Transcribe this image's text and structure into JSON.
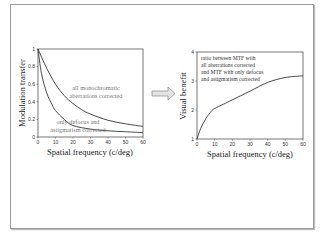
{
  "chart_data": [
    {
      "type": "line",
      "title": "",
      "xlabel": "Spatial frequency (c/deg)",
      "ylabel": "Modulation transfer",
      "xlim": [
        0,
        60
      ],
      "ylim": [
        0,
        1
      ],
      "xticks": [
        "0",
        "10",
        "20",
        "30",
        "40",
        "50",
        "60"
      ],
      "yticks": [
        "0",
        "0.2",
        "0.4",
        "0.6",
        "0.8",
        "1"
      ],
      "grid": false,
      "series": [
        {
          "name": "all monochromatic aberrations corrected",
          "x": [
            0,
            5,
            10,
            15,
            20,
            25,
            30,
            40,
            50,
            60
          ],
          "values": [
            1.0,
            0.78,
            0.6,
            0.47,
            0.38,
            0.31,
            0.26,
            0.19,
            0.15,
            0.12
          ]
        },
        {
          "name": "only defocus and astigmatism corrected",
          "x": [
            0,
            2,
            5,
            8,
            10,
            15,
            20,
            30,
            40,
            50,
            60
          ],
          "values": [
            1.0,
            0.72,
            0.5,
            0.37,
            0.3,
            0.2,
            0.13,
            0.09,
            0.07,
            0.06,
            0.05
          ]
        }
      ],
      "annotations": [
        {
          "lines": [
            "all monochromatic",
            "aberrations corrected"
          ]
        },
        {
          "lines": [
            "only defocus and",
            "astigmatism corrected"
          ]
        }
      ]
    },
    {
      "type": "line",
      "title": "",
      "xlabel": "Spatial frequency (c/deg)",
      "ylabel": "Visual benefit",
      "xlim": [
        0,
        60
      ],
      "ylim": [
        1,
        4
      ],
      "xticks": [
        "0",
        "10",
        "20",
        "30",
        "40",
        "50",
        "60"
      ],
      "yticks": [
        "1",
        "2",
        "3",
        "4"
      ],
      "grid": false,
      "series": [
        {
          "name": "ratio",
          "x": [
            0,
            2,
            5,
            8,
            10,
            15,
            20,
            30,
            40,
            50,
            60
          ],
          "values": [
            1.0,
            1.35,
            1.7,
            1.95,
            2.05,
            2.2,
            2.35,
            2.65,
            2.95,
            3.12,
            3.18
          ]
        }
      ],
      "annotations": [
        {
          "lines": [
            "ratio between MTF with",
            "all aberrations corrected",
            "and MTF with only defocus",
            "and astigmatism corrected"
          ]
        }
      ]
    }
  ]
}
